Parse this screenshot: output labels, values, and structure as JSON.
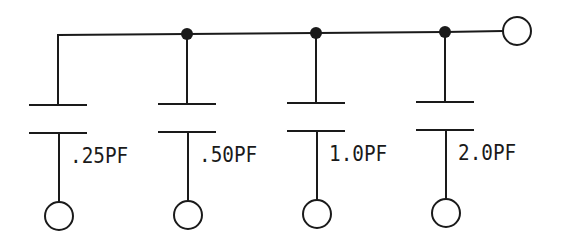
{
  "diagram": {
    "type": "circuit-schematic",
    "bus": {
      "output_terminal": "right"
    },
    "capacitors": [
      {
        "label": ".25PF",
        "value_pf": 0.25
      },
      {
        "label": ".50PF",
        "value_pf": 0.5
      },
      {
        "label": "1.0PF",
        "value_pf": 1.0
      },
      {
        "label": "2.0PF",
        "value_pf": 2.0
      }
    ],
    "colors": {
      "line": "#1a1a1a",
      "background": "#ffffff"
    }
  }
}
